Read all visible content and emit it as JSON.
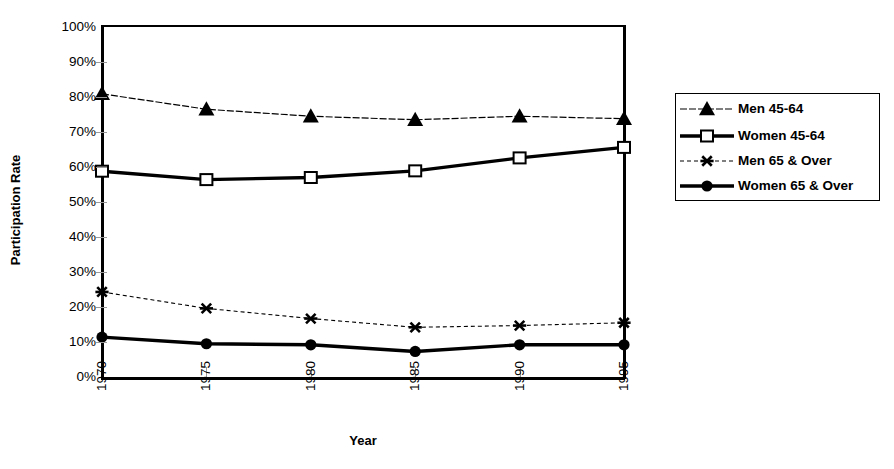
{
  "chart_data": {
    "type": "line",
    "title": "",
    "xlabel": "Year",
    "ylabel": "Participation Rate",
    "x": [
      1970,
      1975,
      1980,
      1985,
      1990,
      1995
    ],
    "xticklabels": [
      "1970",
      "1975",
      "1980",
      "1985",
      "1990",
      "1995"
    ],
    "yticklabels": [
      "0%",
      "10%",
      "20%",
      "30%",
      "40%",
      "50%",
      "60%",
      "70%",
      "80%",
      "90%",
      "100%"
    ],
    "yticks": [
      0,
      10,
      20,
      30,
      40,
      50,
      60,
      70,
      80,
      90,
      100
    ],
    "ylim": [
      0,
      100
    ],
    "xlim": [
      1970,
      1995
    ],
    "grid": false,
    "legend_position": "right",
    "series": [
      {
        "name": "Men 45-64",
        "marker": "triangle",
        "line": "thin-dashed",
        "color": "#000000",
        "values": [
          80.9,
          76.5,
          74.5,
          73.5,
          74.5,
          73.8
        ]
      },
      {
        "name": "Women 45-64",
        "marker": "square",
        "line": "thick-solid",
        "color": "#000000",
        "values": [
          58.8,
          56.4,
          57.0,
          58.9,
          62.6,
          65.6
        ]
      },
      {
        "name": "Men 65 & Over",
        "marker": "asterisk",
        "line": "thin-dotted",
        "color": "#000000",
        "values": [
          24.3,
          19.6,
          16.7,
          14.2,
          14.7,
          15.5
        ]
      },
      {
        "name": "Women 65 & Over",
        "marker": "circle",
        "line": "thick-solid",
        "color": "#000000",
        "values": [
          11.4,
          9.5,
          9.2,
          7.3,
          9.2,
          9.2
        ]
      }
    ]
  },
  "axes": {
    "y_title": "Participation Rate",
    "x_title": "Year"
  },
  "legend": {
    "items": [
      {
        "label": "Men 45-64"
      },
      {
        "label": "Women 45-64"
      },
      {
        "label": "Men 65 & Over"
      },
      {
        "label": "Women 65 & Over"
      }
    ]
  }
}
